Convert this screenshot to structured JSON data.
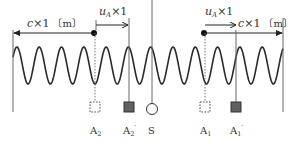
{
  "figure": {
    "type": "doppler-wave-diagram",
    "colors": {
      "line": "#555555",
      "wave": "#2a2a2a",
      "text": "#333333",
      "filled_marker": "#606060",
      "dot": "#111111"
    }
  },
  "labels": {
    "left_distance": {
      "symbol": "c",
      "expr": "×1",
      "unit": "〔m〕"
    },
    "left_velocity": {
      "symbol": "u",
      "sub": "A",
      "expr": "×1"
    },
    "right_velocity": {
      "symbol": "u",
      "sub": "A",
      "expr": "×1"
    },
    "right_distance": {
      "symbol": "c",
      "expr": "×1",
      "unit": "〔m〕"
    }
  },
  "markers": [
    {
      "id": "A2",
      "label": "A",
      "sub": "2",
      "prime": "",
      "style": "dashed-square"
    },
    {
      "id": "A2p",
      "label": "A",
      "sub": "2",
      "prime": "′",
      "style": "filled-square"
    },
    {
      "id": "S",
      "label": "S",
      "sub": "",
      "prime": "",
      "style": "open-circle"
    },
    {
      "id": "A1",
      "label": "A",
      "sub": "1",
      "prime": "",
      "style": "dashed-square"
    },
    {
      "id": "A1p",
      "label": "A",
      "sub": "1",
      "prime": "′",
      "style": "filled-square"
    }
  ]
}
